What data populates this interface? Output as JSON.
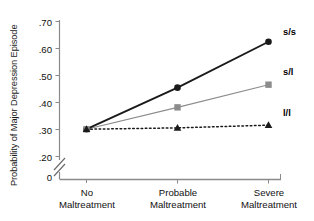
{
  "chart_data": {
    "type": "line",
    "title": "",
    "xlabel": "",
    "ylabel": "Probability of Major Depression Episode",
    "categories": [
      "No Maltreatment",
      "Probable Maltreatment",
      "Severe Maltreatment"
    ],
    "category_lines": [
      [
        "No",
        "Maltreatment"
      ],
      [
        "Probable",
        "Maltreatment"
      ],
      [
        "Severe",
        "Maltreatment"
      ]
    ],
    "ylim": [
      0.2,
      0.7
    ],
    "yticks": [
      0.2,
      0.3,
      0.4,
      0.5,
      0.6,
      0.7
    ],
    "ytick_labels": [
      ".20",
      ".30",
      ".40",
      ".50",
      ".60",
      ".70"
    ],
    "y_origin_label": "0",
    "axis_break": true,
    "grid": false,
    "legend_position": "right-of-lines",
    "series": [
      {
        "name": "s/s",
        "values": [
          0.301,
          0.455,
          0.625
        ],
        "color": "#1a1a1a",
        "marker": "circle",
        "line_style": "solid",
        "line_width": 1.9
      },
      {
        "name": "s/l",
        "values": [
          0.301,
          0.382,
          0.466
        ],
        "color": "#8c8c8c",
        "marker": "square",
        "line_style": "solid",
        "line_width": 1.1
      },
      {
        "name": "l/l",
        "values": [
          0.301,
          0.306,
          0.316
        ],
        "color": "#1a1a1a",
        "marker": "triangle",
        "line_style": "dotted",
        "line_width": 1.5
      }
    ]
  },
  "axes": {
    "y_axis_name": "probability-axis",
    "x_axis_name": "maltreatment-axis"
  }
}
